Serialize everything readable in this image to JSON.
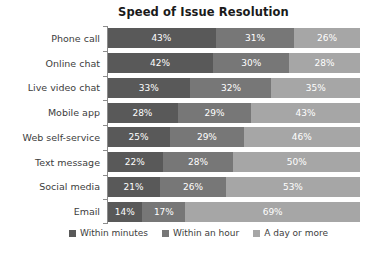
{
  "chart_data": {
    "type": "bar",
    "subtype": "stacked-bar-horizontal-100pct",
    "title": "Speed of Issue Resolution",
    "xlabel": "",
    "ylabel": "",
    "xlim": [
      0,
      100
    ],
    "grid": false,
    "legend_position": "bottom-center",
    "orientation": "horizontal",
    "value_suffix": "%",
    "categories": [
      "Phone call",
      "Online chat",
      "Live video chat",
      "Mobile app",
      "Web self-service",
      "Text message",
      "Social media",
      "Email"
    ],
    "series": [
      {
        "name": "Within minutes",
        "color": "#595959",
        "values": [
          43,
          42,
          33,
          28,
          25,
          22,
          21,
          14
        ],
        "labels": [
          "43%",
          "42%",
          "33%",
          "28%",
          "25%",
          "22%",
          "21%",
          "14%"
        ]
      },
      {
        "name": "Within an hour",
        "color": "#777777",
        "values": [
          31,
          30,
          32,
          29,
          29,
          28,
          26,
          17
        ],
        "labels": [
          "31%",
          "30%",
          "32%",
          "29%",
          "29%",
          "28%",
          "26%",
          "17%"
        ]
      },
      {
        "name": "A day or more",
        "color": "#a6a6a6",
        "values": [
          26,
          28,
          35,
          43,
          46,
          50,
          53,
          69
        ],
        "labels": [
          "26%",
          "28%",
          "35%",
          "43%",
          "46%",
          "50%",
          "53%",
          "69%"
        ]
      }
    ]
  },
  "colors": {
    "within_minutes": "#595959",
    "within_an_hour": "#777777",
    "a_day_or_more": "#a6a6a6",
    "axis": "#8c8c8c",
    "title_text": "#1a1a1a",
    "label_text": "#3d3d3d",
    "value_text": "#ffffff",
    "background": "#ffffff"
  }
}
